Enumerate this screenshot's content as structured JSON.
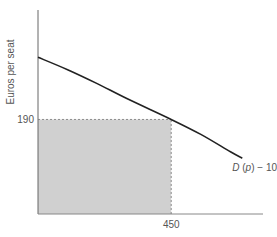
{
  "chart_data": {
    "type": "line",
    "title": "",
    "xlabel": "",
    "ylabel": "Euros per seat",
    "xlim": [
      0,
      760
    ],
    "ylim": [
      0,
      410
    ],
    "x_ticks": [
      {
        "value": 450,
        "label": "450"
      }
    ],
    "y_ticks": [
      {
        "value": 190,
        "label": "190"
      }
    ],
    "grid": false,
    "series": [
      {
        "name": "D (p) − 100",
        "points": [
          [
            0,
            315
          ],
          [
            100,
            290
          ],
          [
            200,
            262
          ],
          [
            300,
            232
          ],
          [
            450,
            190
          ],
          [
            550,
            160
          ],
          [
            650,
            125
          ],
          [
            690,
            112
          ]
        ]
      }
    ],
    "shaded_region": {
      "x": [
        0,
        450
      ],
      "y": [
        0,
        190
      ],
      "color": "#d0d0d0"
    },
    "reference_lines": [
      {
        "type": "horizontal",
        "value": 190,
        "from_x": 0,
        "to_x": 450,
        "style": "dashed"
      },
      {
        "type": "vertical",
        "value": 450,
        "from_y": 0,
        "to_y": 190,
        "style": "dashed"
      }
    ],
    "annotations": [
      {
        "text": "D (p) − 100",
        "near": "curve-end"
      }
    ],
    "colors": {
      "curve": "#222222",
      "axis": "#666666",
      "shade": "#d0d0d0",
      "text": "#555555"
    }
  }
}
